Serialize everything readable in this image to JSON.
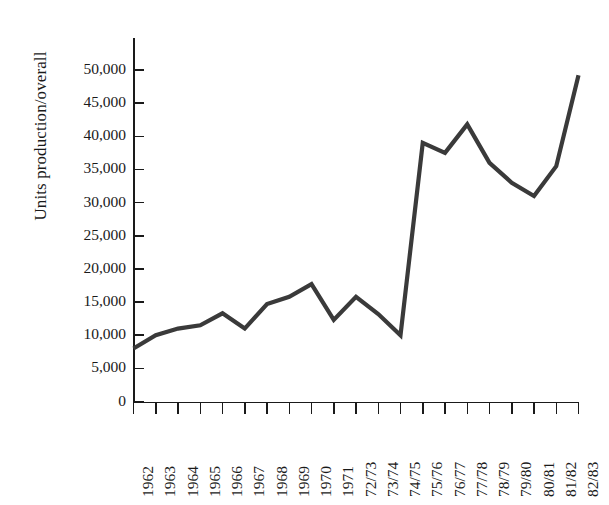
{
  "caption": {
    "partial_top_text": ""
  },
  "chart_data": {
    "type": "line",
    "title": "",
    "xlabel": "",
    "ylabel": "Units production/overall",
    "ylim": [
      0,
      52000
    ],
    "ytick_values": [
      0,
      5000,
      10000,
      15000,
      20000,
      25000,
      30000,
      35000,
      40000,
      45000,
      50000
    ],
    "ytick_labels": [
      "0",
      "5,000",
      "10,000",
      "15,000",
      "20,000",
      "25,000",
      "30,000",
      "35,000",
      "40,000",
      "45,000",
      "50,000"
    ],
    "grid": false,
    "legend": null,
    "line_color": "#3a3a3a",
    "categories": [
      "1962",
      "1963",
      "1964",
      "1965",
      "1966",
      "1967",
      "1968",
      "1969",
      "1970",
      "1971",
      "72/73",
      "73/74",
      "74/75",
      "75/76",
      "76/77",
      "77/78",
      "78/79",
      "79/80",
      "80/81",
      "81/82",
      "82/83"
    ],
    "values": [
      8000,
      10000,
      11000,
      11500,
      13300,
      11000,
      14700,
      15800,
      17700,
      12300,
      15800,
      13200,
      10000,
      39000,
      37500,
      41800,
      36000,
      33000,
      31000,
      35500,
      49200
    ]
  }
}
